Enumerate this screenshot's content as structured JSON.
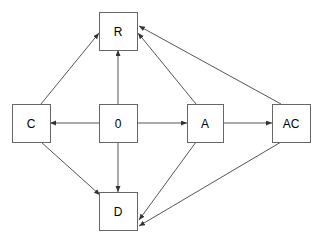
{
  "diagram": {
    "background_color": "#ffffff",
    "node_fill_color": "#ffffff",
    "node_border_color": "#666666",
    "edge_color": "#555555",
    "label_color": "#000000",
    "nodes": [
      {
        "id": "R",
        "label": "R",
        "x": 99,
        "y": 12,
        "w": 38,
        "h": 38
      },
      {
        "id": "C",
        "label": "C",
        "x": 12,
        "y": 104,
        "w": 38,
        "h": 38
      },
      {
        "id": "0",
        "label": "0",
        "x": 99,
        "y": 104,
        "w": 38,
        "h": 38
      },
      {
        "id": "A",
        "label": "A",
        "x": 187,
        "y": 104,
        "w": 36,
        "h": 38
      },
      {
        "id": "AC",
        "label": "AC",
        "x": 272,
        "y": 104,
        "w": 38,
        "h": 38
      },
      {
        "id": "D",
        "label": "D",
        "x": 99,
        "y": 192,
        "w": 38,
        "h": 38
      }
    ],
    "edges": [
      {
        "from": "0",
        "to": "C",
        "x1": 99,
        "y1": 123,
        "x2": 50,
        "y2": 123
      },
      {
        "from": "0",
        "to": "R",
        "x1": 118,
        "y1": 104,
        "x2": 118,
        "y2": 50
      },
      {
        "from": "0",
        "to": "A",
        "x1": 137,
        "y1": 123,
        "x2": 187,
        "y2": 123
      },
      {
        "from": "0",
        "to": "D",
        "x1": 118,
        "y1": 142,
        "x2": 118,
        "y2": 192
      },
      {
        "from": "C",
        "to": "R",
        "x1": 41,
        "y1": 104,
        "x2": 99,
        "y2": 33
      },
      {
        "from": "C",
        "to": "D",
        "x1": 41,
        "y1": 142,
        "x2": 100,
        "y2": 195
      },
      {
        "from": "A",
        "to": "R",
        "x1": 196,
        "y1": 104,
        "x2": 138,
        "y2": 33
      },
      {
        "from": "A",
        "to": "AC",
        "x1": 223,
        "y1": 123,
        "x2": 272,
        "y2": 123
      },
      {
        "from": "A",
        "to": "D",
        "x1": 196,
        "y1": 142,
        "x2": 139,
        "y2": 220
      },
      {
        "from": "AC",
        "to": "R",
        "x1": 281,
        "y1": 104,
        "x2": 139,
        "y2": 26
      },
      {
        "from": "AC",
        "to": "D",
        "x1": 281,
        "y1": 142,
        "x2": 139,
        "y2": 226
      }
    ]
  }
}
